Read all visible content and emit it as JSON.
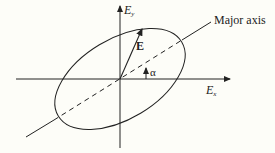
{
  "diagram": {
    "type": "polarization-ellipse",
    "labels": {
      "y_axis": "E",
      "y_axis_sub": "y",
      "x_axis": "E",
      "x_axis_sub": "x",
      "vector": "E",
      "angle": "α",
      "major_axis": "Major axis"
    },
    "colors": {
      "stroke": "#222222",
      "background": "#fdfdf8"
    }
  }
}
